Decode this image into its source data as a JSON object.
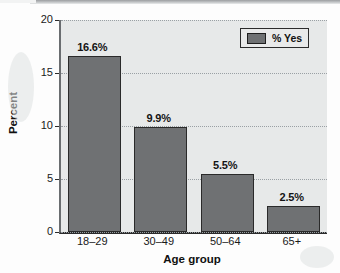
{
  "chart_data": {
    "type": "bar",
    "title": "",
    "subtitle": "",
    "xlabel": "Age group",
    "ylabel": "Percent",
    "categories": [
      "18–29",
      "30–49",
      "50–64",
      "65+"
    ],
    "values": [
      16.6,
      9.9,
      5.5,
      2.5
    ],
    "data_labels": [
      "16.6%",
      "9.9%",
      "5.5%",
      "2.5%"
    ],
    "series": [
      {
        "name": "% Yes",
        "values": [
          16.6,
          9.9,
          5.5,
          2.5
        ]
      }
    ],
    "ylim": [
      0,
      20
    ],
    "yticks": [
      0,
      5,
      10,
      15,
      20
    ],
    "ytick_labels": [
      "0",
      "5",
      "10",
      "15",
      "20"
    ],
    "grid": "horizontal-dotted",
    "legend_position": "top-right",
    "colors": {
      "bar_fill": "#6f7173",
      "bar_edge": "#2a2a2a",
      "plot_background": "#e7e9e9",
      "gridline": "#9aa0a4",
      "axis": "#2b2b2b",
      "text": "#141414"
    }
  },
  "legend": {
    "entries": [
      {
        "label": "% Yes",
        "swatch_color": "#6f7173"
      }
    ]
  },
  "axes": {
    "y_title": "Percent",
    "x_title": "Age group"
  }
}
